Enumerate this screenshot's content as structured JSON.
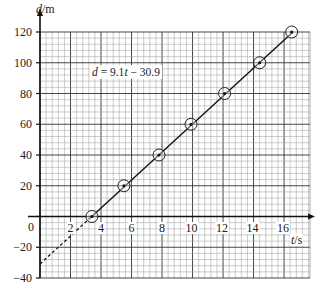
{
  "chart_data": {
    "type": "line",
    "title": "",
    "xlabel": "t/s",
    "ylabel": "d/m",
    "xlim": [
      0,
      17.7
    ],
    "ylim": [
      -40,
      120
    ],
    "x_ticks": [
      0,
      2,
      4,
      6,
      8,
      10,
      12,
      14,
      16
    ],
    "x_tick_labels": [
      "0",
      "2",
      "4",
      "6",
      "8",
      "10",
      "12",
      "14",
      "16"
    ],
    "y_ticks": [
      -40,
      -20,
      0,
      20,
      40,
      60,
      80,
      100,
      120
    ],
    "y_tick_labels": [
      "−40",
      "−20",
      "0",
      "20",
      "40",
      "60",
      "80",
      "100",
      "120"
    ],
    "grid": true,
    "annotation": "d = 9.1t − 30.9",
    "series": [
      {
        "name": "measured points",
        "style": "circled points",
        "x": [
          3.4,
          5.5,
          7.8,
          9.9,
          12.1,
          14.4,
          16.5
        ],
        "y": [
          0,
          20,
          40,
          60,
          80,
          100,
          120
        ]
      },
      {
        "name": "best-fit line",
        "style": "solid line from t≈3.4 to t≈16.5, dashed extrapolation to t=0",
        "equation": "d = 9.1t - 30.9",
        "slope": 9.1,
        "intercept": -30.9
      }
    ]
  },
  "labels": {
    "y_axis": "/m",
    "y_axis_var": "d",
    "x_axis": "/s",
    "x_axis_var": "t",
    "equation_var": "d",
    "equation_rest_a": " = 9.1",
    "equation_var_t": "t",
    "equation_rest_b": " − 30.9"
  }
}
